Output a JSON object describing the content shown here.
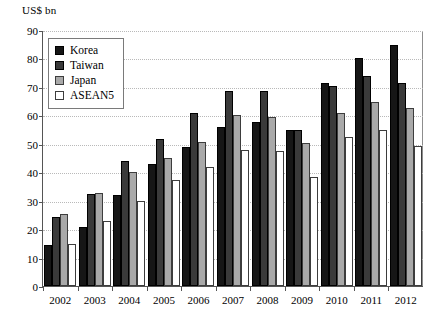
{
  "axis_unit_label": "US$ bn",
  "legend": {
    "position": "top-left-inside",
    "entries": [
      {
        "label": "Korea",
        "key": "korea",
        "color": "#161616",
        "icon": "filled-square-icon"
      },
      {
        "label": "Taiwan",
        "key": "taiwan",
        "color": "#3a3a3a",
        "icon": "filled-square-icon"
      },
      {
        "label": "Japan",
        "key": "japan",
        "color": "#a9a9a9",
        "icon": "filled-square-icon"
      },
      {
        "label": "ASEAN5",
        "key": "asean5",
        "color": "#ffffff",
        "icon": "empty-square-icon"
      }
    ]
  },
  "chart_data": {
    "type": "bar",
    "title": "",
    "xlabel": "",
    "ylabel": "US$ bn",
    "ylim": [
      0,
      90
    ],
    "yticks": [
      0,
      10,
      20,
      30,
      40,
      50,
      60,
      70,
      80,
      90
    ],
    "grid": true,
    "grid_axis": "y",
    "grid_style": "dotted",
    "legend_position": "top-left-inside",
    "categories": [
      "2002",
      "2003",
      "2004",
      "2005",
      "2006",
      "2007",
      "2008",
      "2009",
      "2010",
      "2011",
      "2012"
    ],
    "series": [
      {
        "name": "Korea",
        "color": "#161616",
        "values": [
          14.5,
          21.0,
          32.0,
          43.0,
          49.0,
          56.0,
          58.0,
          55.0,
          71.5,
          80.5,
          85.0
        ]
      },
      {
        "name": "Taiwan",
        "color": "#3a3a3a",
        "values": [
          24.5,
          32.5,
          44.0,
          52.0,
          61.0,
          69.0,
          69.0,
          55.0,
          70.5,
          74.0,
          71.5
        ]
      },
      {
        "name": "Japan",
        "color": "#a9a9a9",
        "values": [
          25.3,
          33.0,
          40.3,
          45.3,
          51.0,
          60.5,
          59.5,
          50.3,
          61.0,
          65.0,
          63.0
        ]
      },
      {
        "name": "ASEAN5",
        "color": "#ffffff",
        "values": [
          15.0,
          23.0,
          30.0,
          37.5,
          42.0,
          48.0,
          47.5,
          38.5,
          52.5,
          55.0,
          49.5
        ]
      }
    ]
  }
}
